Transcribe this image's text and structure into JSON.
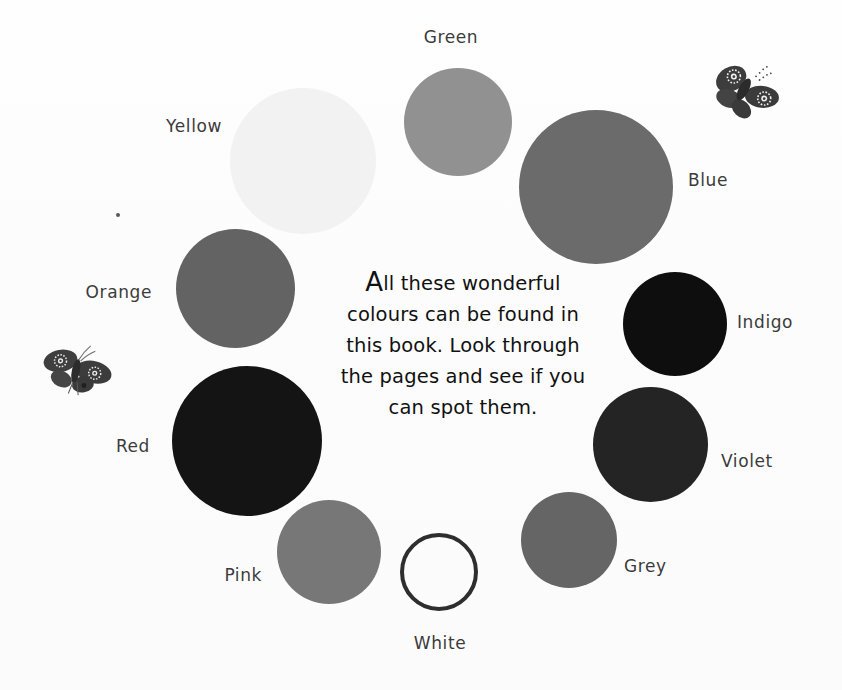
{
  "page": {
    "title": "Colours",
    "background": "#fdfdfd",
    "width": 842,
    "height": 690
  },
  "blurb": {
    "dropcap": "A",
    "rest": "ll these wonderful colours can be found in this book. Look through the pages and see if you can spot them.",
    "full_text": "All these wonderful colours can be found in this book. Look through the pages and see if you can spot them.",
    "lines": [
      "All these wonderful",
      "colours can be found in",
      "this book. Look through",
      "the pages and see if you",
      "can spot them."
    ],
    "text_color": "#111111"
  },
  "label_color": "#3b3b3b",
  "swatches": [
    {
      "name": "green",
      "label": "Green",
      "color": "#919191",
      "x": 404,
      "y": 68,
      "size": 108,
      "filled": true,
      "label_x": 451,
      "label_y": 29,
      "label_align": "center"
    },
    {
      "name": "yellow",
      "label": "Yellow",
      "color": "#f2f2f2",
      "x": 230,
      "y": 88,
      "size": 146,
      "filled": true,
      "label_x": 222,
      "label_y": 118,
      "label_align": "left"
    },
    {
      "name": "blue",
      "label": "Blue",
      "color": "#6b6b6b",
      "x": 519,
      "y": 110,
      "size": 154,
      "filled": true,
      "label_x": 688,
      "label_y": 172,
      "label_align": "right"
    },
    {
      "name": "orange",
      "label": "Orange",
      "color": "#636363",
      "x": 176,
      "y": 229,
      "size": 119,
      "filled": true,
      "label_x": 152,
      "label_y": 284,
      "label_align": "left"
    },
    {
      "name": "indigo",
      "label": "Indigo",
      "color": "#0e0e0e",
      "x": 623,
      "y": 272,
      "size": 104,
      "filled": true,
      "label_x": 737,
      "label_y": 314,
      "label_align": "right"
    },
    {
      "name": "red",
      "label": "Red",
      "color": "#141414",
      "x": 172,
      "y": 366,
      "size": 150,
      "filled": true,
      "label_x": 150,
      "label_y": 438,
      "label_align": "left"
    },
    {
      "name": "violet",
      "label": "Violet",
      "color": "#242424",
      "x": 593,
      "y": 387,
      "size": 115,
      "filled": true,
      "label_x": 721,
      "label_y": 453,
      "label_align": "right"
    },
    {
      "name": "pink",
      "label": "Pink",
      "color": "#777777",
      "x": 277,
      "y": 500,
      "size": 104,
      "filled": true,
      "label_x": 262,
      "label_y": 567,
      "label_align": "left"
    },
    {
      "name": "grey",
      "label": "Grey",
      "color": "#656565",
      "x": 521,
      "y": 492,
      "size": 96,
      "filled": true,
      "label_x": 624,
      "label_y": 558,
      "label_align": "right"
    },
    {
      "name": "white",
      "label": "White",
      "color": "#ffffff",
      "x": 400,
      "y": 533,
      "size": 78,
      "filled": false,
      "label_x": 440,
      "label_y": 635,
      "label_align": "center"
    }
  ],
  "decorations": {
    "butterflies": [
      {
        "name": "butterfly-top-right",
        "x": 708,
        "y": 56,
        "width": 76,
        "height": 70,
        "rotation": -8
      },
      {
        "name": "butterfly-left",
        "x": 36,
        "y": 338,
        "width": 82,
        "height": 62,
        "rotation": 4
      }
    ],
    "speck": {
      "name": "ink-speck",
      "x": 116,
      "y": 213
    }
  }
}
